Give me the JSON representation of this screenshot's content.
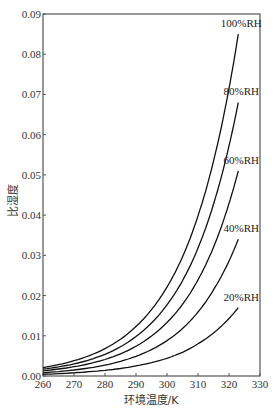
{
  "chart_data": {
    "type": "line",
    "title": "",
    "xlabel": "环境温度/K",
    "ylabel": "比湿度",
    "xlim": [
      260,
      330
    ],
    "ylim": [
      0,
      0.09
    ],
    "grid": false,
    "legend": "inline labels at curve ends",
    "x_ticks": [
      260,
      270,
      280,
      290,
      300,
      310,
      320,
      330
    ],
    "x_tick_labels": [
      "260",
      "270",
      "280",
      "290",
      "300",
      "310",
      "320",
      "330"
    ],
    "y_ticks": [
      0,
      0.01,
      0.02,
      0.03,
      0.04,
      0.05,
      0.06,
      0.07,
      0.08,
      0.09
    ],
    "y_tick_labels": [
      "0.00",
      "0.01",
      "0.02",
      "0.03",
      "0.04",
      "0.05",
      "0.06",
      "0.07",
      "0.08",
      "0.09"
    ],
    "x": [
      260,
      270,
      280,
      290,
      300,
      305,
      310,
      315,
      320,
      323
    ],
    "series": [
      {
        "name": "100%RH",
        "values": [
          0.0021,
          0.0038,
          0.0068,
          0.0123,
          0.0221,
          0.0296,
          0.0398,
          0.0534,
          0.0715,
          0.085
        ]
      },
      {
        "name": "80%RH",
        "values": [
          0.0017,
          0.003,
          0.0054,
          0.0098,
          0.0177,
          0.0237,
          0.0318,
          0.0427,
          0.0572,
          0.068
        ]
      },
      {
        "name": "60%RH",
        "values": [
          0.0013,
          0.0023,
          0.0041,
          0.0074,
          0.0133,
          0.0178,
          0.0239,
          0.032,
          0.0429,
          0.051
        ]
      },
      {
        "name": "40%RH",
        "values": [
          0.0008,
          0.0015,
          0.0027,
          0.0049,
          0.0088,
          0.0118,
          0.0159,
          0.0214,
          0.0286,
          0.034
        ]
      },
      {
        "name": "20%RH",
        "values": [
          0.0004,
          0.0008,
          0.0014,
          0.0025,
          0.0044,
          0.0059,
          0.008,
          0.0107,
          0.0143,
          0.017
        ]
      }
    ]
  },
  "colors": {
    "axis": "#555555",
    "curve": "#111111",
    "text": "#333333"
  }
}
